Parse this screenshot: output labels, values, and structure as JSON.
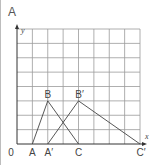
{
  "panel": {
    "label": "A"
  },
  "axes": {
    "x_label": "x",
    "y_label": "y",
    "origin_label": "0"
  },
  "grid": {
    "columns": 8,
    "rows": 8
  },
  "points": [
    {
      "name": "A",
      "x": 1,
      "y": 0
    },
    {
      "name": "B",
      "x": 2,
      "y": 3
    },
    {
      "name": "A′",
      "x": 2,
      "y": 0
    },
    {
      "name": "C",
      "x": 4,
      "y": 0
    },
    {
      "name": "B′",
      "x": 4,
      "y": 3
    },
    {
      "name": "C′",
      "x": 8,
      "y": 0
    }
  ],
  "segments": [
    [
      "A",
      "B"
    ],
    [
      "B",
      "C"
    ],
    [
      "A′",
      "B′"
    ],
    [
      "B′",
      "C′"
    ]
  ],
  "colors": {
    "grid": "#9a9a9a",
    "lines": "#444444",
    "frame": "#bdbdbd"
  }
}
